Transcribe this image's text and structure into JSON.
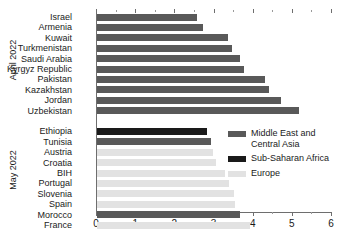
{
  "chart_data": {
    "type": "bar",
    "orientation": "horizontal",
    "title": "",
    "xlabel": "",
    "ylabel": "",
    "xlim": [
      0,
      6
    ],
    "xticks": [
      0,
      1,
      2,
      3,
      4,
      5,
      6
    ],
    "xtick_labels": [
      "0",
      "1",
      "2",
      "3",
      "4",
      "5",
      "6"
    ],
    "minor_tick_step": 0.5,
    "grid": false,
    "legend_position": "center-right",
    "groups": [
      {
        "label": "April 2022",
        "categories": [
          "Israel",
          "Armenia",
          "Kuwait",
          "Turkmenistan",
          "Saudi Arabia",
          "Kyrgyz Republic",
          "Pakistan",
          "Kazakhstan",
          "Jordan",
          "Uzbekistan"
        ],
        "values": [
          2.55,
          2.7,
          3.35,
          3.45,
          3.65,
          3.75,
          4.3,
          4.4,
          4.7,
          5.15
        ],
        "regions": [
          "Middle East and Central Asia",
          "Middle East and Central Asia",
          "Middle East and Central Asia",
          "Middle East and Central Asia",
          "Middle East and Central Asia",
          "Middle East and Central Asia",
          "Middle East and Central Asia",
          "Middle East and Central Asia",
          "Middle East and Central Asia",
          "Middle East and Central Asia"
        ]
      },
      {
        "label": "May 2022",
        "categories": [
          "Ethiopia",
          "Tunisia",
          "Austria",
          "Croatia",
          "BIH",
          "Portugal",
          "Slovenia",
          "Spain",
          "Morocco",
          "France"
        ],
        "values": [
          2.82,
          2.9,
          2.97,
          3.05,
          3.28,
          3.38,
          3.5,
          3.52,
          3.65,
          3.9
        ],
        "regions": [
          "Sub-Saharan Africa",
          "Middle East and Central Asia",
          "Europe",
          "Europe",
          "Europe",
          "Europe",
          "Europe",
          "Europe",
          "Middle East and Central Asia",
          "Europe"
        ]
      }
    ],
    "legend": [
      {
        "label": "Middle East and\nCentral Asia",
        "color": "#595959"
      },
      {
        "label": "Sub-Saharan Africa",
        "color": "#1a1a1a"
      },
      {
        "label": "Europe",
        "color": "#e2e2e2"
      }
    ],
    "colors": {
      "Middle East and Central Asia": "#595959",
      "Sub-Saharan Africa": "#1a1a1a",
      "Europe": "#e2e2e2",
      "axis": "#6e6e6e",
      "text": "#1a1a1a",
      "background": "#ffffff"
    }
  }
}
